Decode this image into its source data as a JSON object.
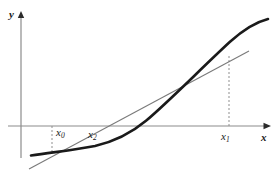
{
  "figure": {
    "kind": "secant-method-diagram",
    "background_color": "#ffffff"
  },
  "axes": {
    "y_axis": {
      "label": "y",
      "color": "#8c8c8c",
      "x_px": 21,
      "top_px": 13,
      "bottom_px": 158,
      "arrow": "up"
    },
    "x_axis": {
      "label": "x",
      "color": "#8c8c8c",
      "y_px": 126,
      "left_px": 8,
      "right_px": 270,
      "arrow": "right"
    }
  },
  "labels": {
    "y": "y",
    "x": "x",
    "x0_base": "x",
    "x0_sub": "0",
    "x2_base": "x",
    "x2_sub": "2",
    "x1_base": "x",
    "x1_sub": "1"
  },
  "curve": {
    "name": "function-curve",
    "color": "#1a1a1a",
    "stroke_width": 2.6,
    "description": "increasing convex curve f(x) crossing the x-axis near x=140px",
    "path": "M 31,155.5 C 52,152.2 74,150.0 95,146.0 C 116,141.0 132,132.5 146,121.0 C 170,101.0 200,70.0 230,42.0 C 244,29.5 256,22.0 268,19.0",
    "root_crossing_px": [
      140,
      126
    ]
  },
  "secant_line": {
    "name": "secant-line",
    "color": "#7a7a7a",
    "stroke_width": 1.1,
    "description": "straight chord through (x0, f(x0)) and (x1, f(x1)), extended both directions",
    "x1_px": 29,
    "y1_px": 169,
    "x2_px": 249,
    "y2_px": 51
  },
  "dashed_lines": [
    {
      "name": "x0-dashed-line",
      "color": "#8f8f8f",
      "x_px": 52,
      "y_top_px": 126,
      "y_bottom_px": 153,
      "dash": "2,2"
    },
    {
      "name": "x1-dashed-line",
      "color": "#8f8f8f",
      "x_px": 229,
      "y_top_px": 56,
      "y_bottom_px": 126,
      "dash": "2,2"
    }
  ],
  "points": {
    "x0": {
      "x_px": 52,
      "on_curve_y_px": 153
    },
    "x2": {
      "x_px": 96,
      "on_axis_y_px": 126,
      "note": "secant crosses x-axis at x2"
    },
    "x1": {
      "x_px": 229,
      "on_curve_y_px": 56
    }
  },
  "colors": {
    "curve": "#1a1a1a",
    "secant": "#7a7a7a",
    "axis": "#8c8c8c",
    "dash": "#8f8f8f",
    "text": "#1a1a1a",
    "background": "#ffffff"
  }
}
